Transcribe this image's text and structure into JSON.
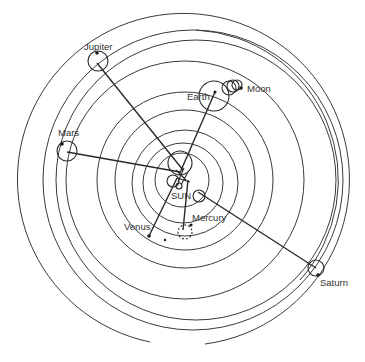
{
  "diagram": {
    "title": "",
    "labels": {
      "sun": "SUN",
      "mercury": "Mercury",
      "venus": "Venus",
      "earth": "Earth",
      "moon": "Moon",
      "mars": "Mars",
      "jupiter": "Jupiter",
      "saturn": "Saturn"
    },
    "colors": {
      "stroke": "#2a2a2a",
      "text": "#333333",
      "background": "#ffffff"
    }
  }
}
